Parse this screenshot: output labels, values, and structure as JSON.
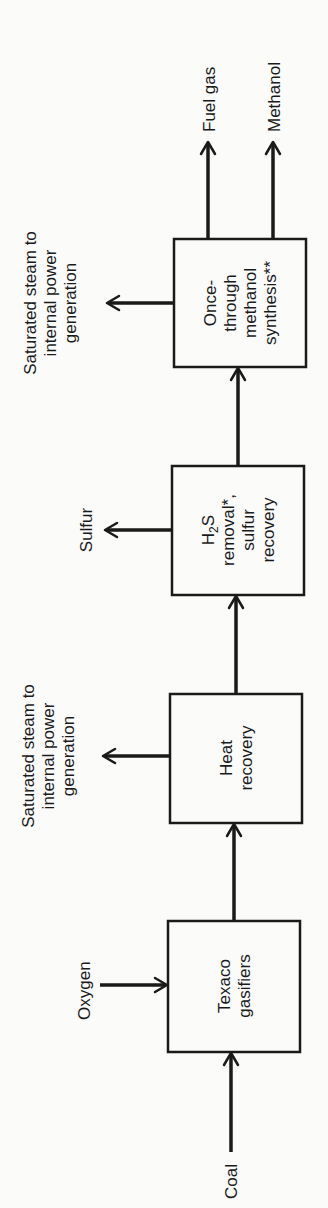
{
  "diagram": {
    "type": "process-flow",
    "orientation": "rotated-90-ccw",
    "boxes": [
      {
        "id": "gasifier",
        "lines": [
          "Texaco",
          "gasifiers"
        ]
      },
      {
        "id": "heat",
        "lines": [
          "Heat",
          "recovery"
        ]
      },
      {
        "id": "h2s",
        "lines": [
          "H2S",
          "removal*,",
          "sulfur",
          "recovery"
        ]
      },
      {
        "id": "methanol",
        "lines": [
          "Once-",
          "through",
          "methanol",
          "synthesis**"
        ]
      }
    ],
    "inputs": {
      "coal": "Coal",
      "oxygen": "Oxygen"
    },
    "side_outputs": {
      "heat_steam": [
        "Saturated steam to",
        "internal power",
        "generation"
      ],
      "sulfur": [
        "Sulfur"
      ],
      "methanol_steam": [
        "Saturated steam to",
        "internal power",
        "generation"
      ]
    },
    "products": {
      "fuel_gas": "Fuel gas",
      "methanol": "Methanol"
    },
    "h2s": {
      "h": "H",
      "sub": "2",
      "s": "S"
    }
  }
}
